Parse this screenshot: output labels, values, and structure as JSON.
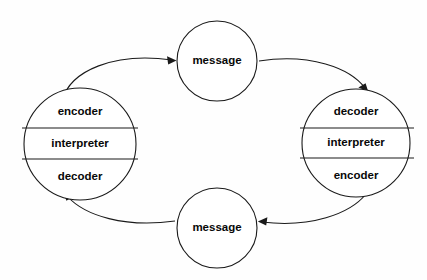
{
  "diagram": {
    "background_color": "#fefefe",
    "stroke_color": "#1a1a1a",
    "text_color": "#080808",
    "left_agent": {
      "name": "left-agent",
      "bands": [
        {
          "label": "encoder"
        },
        {
          "label": "interpreter"
        },
        {
          "label": "decoder"
        }
      ]
    },
    "right_agent": {
      "name": "right-agent",
      "bands": [
        {
          "label": "decoder"
        },
        {
          "label": "interpreter"
        },
        {
          "label": "encoder"
        }
      ]
    },
    "top_message": {
      "label": "message"
    },
    "bottom_message": {
      "label": "message"
    },
    "connectors": [
      {
        "name": "left-to-top-message",
        "from": "left-agent",
        "to": "top-message",
        "arrow": "to-top-message"
      },
      {
        "name": "top-message-to-right",
        "from": "top-message",
        "to": "right-agent",
        "arrow": "to-right-agent"
      },
      {
        "name": "right-to-bottom-message",
        "from": "right-agent",
        "to": "bottom-message",
        "arrow": "to-bottom-message"
      },
      {
        "name": "bottom-message-to-left",
        "from": "bottom-message",
        "to": "left-agent",
        "arrow": "to-left-agent"
      }
    ]
  }
}
